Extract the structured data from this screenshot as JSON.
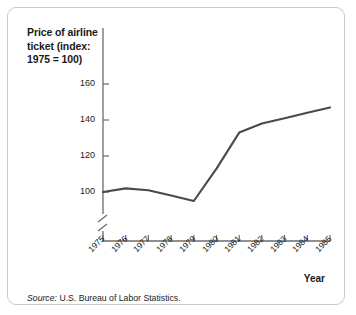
{
  "figure": {
    "title": "Price of airline ticket (index: 1975 = 100)",
    "title_lines": [
      "Price of airline",
      "ticket (index:",
      "1975 = 100)"
    ],
    "source_prefix": "Source:",
    "source_text": "U.S. Bureau of Labor Statistics.",
    "x_axis_caption": "Year",
    "border_color": "#c9c9c9",
    "line_color": "#4a4a4a",
    "axis_color": "#6b6b6b",
    "text_color": "#1a1a1a",
    "background": "#ffffff"
  },
  "chart_data": {
    "type": "line",
    "title": "Price of airline ticket (index: 1975 = 100)",
    "xlabel": "Year",
    "ylabel": "Price of airline ticket (index: 1975 = 100)",
    "categories": [
      "1975",
      "1976",
      "1977",
      "1978",
      "1979",
      "1980",
      "1981",
      "1982",
      "1983",
      "1984",
      "1985"
    ],
    "x": [
      1975,
      1976,
      1977,
      1978,
      1979,
      1980,
      1981,
      1982,
      1983,
      1984,
      1985
    ],
    "values": [
      100,
      102,
      101,
      98,
      95,
      113,
      133,
      138,
      141,
      144,
      147
    ],
    "ylim": [
      90,
      168
    ],
    "y_ticks": [
      100,
      120,
      140,
      160
    ],
    "y_tick_labels": [
      "100",
      "120",
      "140",
      "160"
    ],
    "x_ticks": [
      1975,
      1976,
      1977,
      1978,
      1979,
      1980,
      1981,
      1982,
      1983,
      1984,
      1985
    ],
    "axis_break": true,
    "grid": false,
    "legend": false,
    "series": [
      {
        "name": "Price of airline ticket index",
        "values": [
          100,
          102,
          101,
          98,
          95,
          113,
          133,
          138,
          141,
          144,
          147
        ]
      }
    ],
    "annotations": [
      "Source: U.S. Bureau of Labor Statistics."
    ]
  }
}
